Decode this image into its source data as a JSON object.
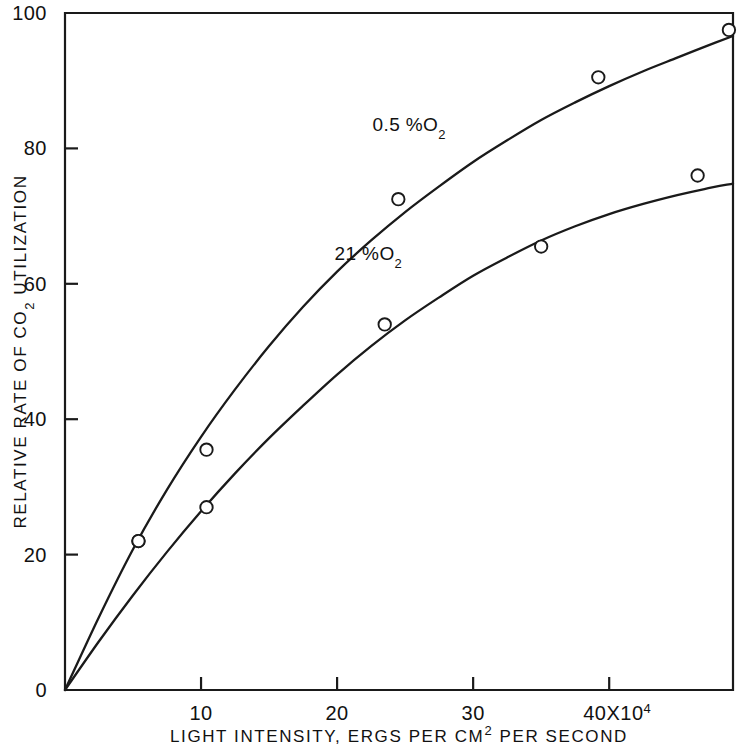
{
  "chart_data": {
    "type": "line",
    "title": "",
    "xlabel": "LIGHT INTENSITY, ERGS PER CM2 PER SECOND",
    "xlabel_parts": {
      "before": "LIGHT INTENSITY, ERGS PER CM",
      "sup": "2",
      "after": " PER SECOND"
    },
    "ylabel": "RELATIVE RATE OF CO2 UTILIZATION",
    "ylabel_parts": {
      "before": "RELATIVE RATE OF CO",
      "sub": "2",
      "after": " UTILIZATION"
    },
    "xlim": [
      0,
      49.1
    ],
    "ylim": [
      0,
      100
    ],
    "x_ticks": [
      10,
      20,
      30,
      40
    ],
    "x_tick_labels": [
      "10",
      "20",
      "30",
      "40X10"
    ],
    "x_tick_exponent": "4",
    "x_axis_multiplier": "X10^4",
    "y_ticks": [
      0,
      20,
      40,
      60,
      80,
      100
    ],
    "y_tick_labels": [
      "0",
      "20",
      "40",
      "60",
      "80",
      "100"
    ],
    "grid": false,
    "legend": "inline-annotations",
    "marker": "open-circle",
    "series": [
      {
        "name": "0.5 % O2",
        "label_text": "0.5 %",
        "label_sub": "2",
        "label_symbol": "O",
        "label_x": 25.3,
        "label_y": 82.5,
        "points": [
          {
            "x": 5.4,
            "y": 22.0
          },
          {
            "x": 10.4,
            "y": 35.5
          },
          {
            "x": 24.5,
            "y": 72.5
          },
          {
            "x": 39.2,
            "y": 90.5
          },
          {
            "x": 48.8,
            "y": 97.5
          }
        ],
        "curve": [
          {
            "x": 0,
            "y": 0
          },
          {
            "x": 2.5,
            "y": 10.8
          },
          {
            "x": 5.0,
            "y": 20.8
          },
          {
            "x": 7.5,
            "y": 29.6
          },
          {
            "x": 10.0,
            "y": 37.4
          },
          {
            "x": 12.5,
            "y": 44.4
          },
          {
            "x": 15.0,
            "y": 50.8
          },
          {
            "x": 17.5,
            "y": 56.6
          },
          {
            "x": 20.0,
            "y": 61.8
          },
          {
            "x": 22.5,
            "y": 66.4
          },
          {
            "x": 25.0,
            "y": 70.6
          },
          {
            "x": 27.5,
            "y": 74.4
          },
          {
            "x": 30.0,
            "y": 78.0
          },
          {
            "x": 32.5,
            "y": 81.2
          },
          {
            "x": 35.0,
            "y": 84.2
          },
          {
            "x": 37.5,
            "y": 86.8
          },
          {
            "x": 40.0,
            "y": 89.2
          },
          {
            "x": 42.5,
            "y": 91.4
          },
          {
            "x": 45.0,
            "y": 93.4
          },
          {
            "x": 47.0,
            "y": 95.0
          },
          {
            "x": 49.1,
            "y": 96.6
          }
        ]
      },
      {
        "name": "21 % O2",
        "label_text": "21 %",
        "label_sub": "2",
        "label_symbol": "O",
        "label_x": 22.3,
        "label_y": 63.5,
        "points": [
          {
            "x": 5.4,
            "y": 22.0
          },
          {
            "x": 10.4,
            "y": 27.0
          },
          {
            "x": 23.5,
            "y": 54.0
          },
          {
            "x": 35.0,
            "y": 65.5
          },
          {
            "x": 46.5,
            "y": 76.0
          }
        ],
        "curve": [
          {
            "x": 0,
            "y": 0
          },
          {
            "x": 2.5,
            "y": 7.2
          },
          {
            "x": 5.0,
            "y": 14.0
          },
          {
            "x": 7.5,
            "y": 20.4
          },
          {
            "x": 10.0,
            "y": 26.4
          },
          {
            "x": 12.5,
            "y": 32.0
          },
          {
            "x": 15.0,
            "y": 37.2
          },
          {
            "x": 17.5,
            "y": 42.0
          },
          {
            "x": 20.0,
            "y": 46.6
          },
          {
            "x": 22.5,
            "y": 50.8
          },
          {
            "x": 25.0,
            "y": 54.6
          },
          {
            "x": 27.5,
            "y": 58.0
          },
          {
            "x": 30.0,
            "y": 61.2
          },
          {
            "x": 32.5,
            "y": 63.9
          },
          {
            "x": 35.0,
            "y": 66.4
          },
          {
            "x": 37.5,
            "y": 68.5
          },
          {
            "x": 40.0,
            "y": 70.3
          },
          {
            "x": 42.5,
            "y": 71.8
          },
          {
            "x": 45.0,
            "y": 73.1
          },
          {
            "x": 47.0,
            "y": 74.0
          },
          {
            "x": 49.1,
            "y": 74.8
          }
        ]
      }
    ],
    "colors": {
      "line": "#1a1a1a",
      "axis": "#1a1a1a",
      "text": "#111111",
      "background": "#ffffff",
      "marker_fill": "#ffffff"
    }
  }
}
